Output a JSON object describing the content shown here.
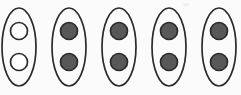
{
  "figure": {
    "background_color": "#fbfbfb",
    "outline_color": "#2b2b2b",
    "filled_circle_color": "#585858",
    "open_circle_color": "#ffffff",
    "canvas": {
      "width": 241,
      "height": 95
    },
    "ellipse_count": 5,
    "circles_per_ellipse": 2,
    "clipped_right_edge": true,
    "items": [
      {
        "index": 1,
        "label": "ellipse-1",
        "center_x": 19,
        "center_y": 47,
        "radius_x": 17,
        "radius_y": 39,
        "stroke_width": 1.7,
        "fill_state": "open",
        "circles": [
          {
            "label": "circle-1-top",
            "cx": 19,
            "cy": 31,
            "r": 8.5,
            "fill": "#ffffff",
            "stroke": "#2b2b2b",
            "stroke_width": 1.7
          },
          {
            "label": "circle-1-bottom",
            "cx": 19,
            "cy": 62,
            "r": 8.5,
            "fill": "#ffffff",
            "stroke": "#2b2b2b",
            "stroke_width": 1.7
          }
        ]
      },
      {
        "index": 2,
        "label": "ellipse-2",
        "center_x": 69,
        "center_y": 47,
        "radius_x": 17,
        "radius_y": 39,
        "stroke_width": 1.7,
        "fill_state": "filled",
        "circles": [
          {
            "label": "circle-2-top",
            "cx": 69,
            "cy": 31,
            "r": 8.5,
            "fill": "#585858",
            "stroke": "#2b2b2b",
            "stroke_width": 1.7
          },
          {
            "label": "circle-2-bottom",
            "cx": 69,
            "cy": 62,
            "r": 8.5,
            "fill": "#585858",
            "stroke": "#2b2b2b",
            "stroke_width": 1.7
          }
        ]
      },
      {
        "index": 3,
        "label": "ellipse-3",
        "center_x": 119,
        "center_y": 47,
        "radius_x": 17,
        "radius_y": 39,
        "stroke_width": 1.7,
        "fill_state": "filled",
        "circles": [
          {
            "label": "circle-3-top",
            "cx": 119,
            "cy": 31,
            "r": 8.5,
            "fill": "#585858",
            "stroke": "#2b2b2b",
            "stroke_width": 1.7
          },
          {
            "label": "circle-3-bottom",
            "cx": 119,
            "cy": 62,
            "r": 8.5,
            "fill": "#585858",
            "stroke": "#2b2b2b",
            "stroke_width": 1.7
          }
        ]
      },
      {
        "index": 4,
        "label": "ellipse-4",
        "center_x": 169,
        "center_y": 47,
        "radius_x": 17,
        "radius_y": 39,
        "stroke_width": 1.7,
        "fill_state": "filled",
        "circles": [
          {
            "label": "circle-4-top",
            "cx": 169,
            "cy": 31,
            "r": 8.5,
            "fill": "#585858",
            "stroke": "#2b2b2b",
            "stroke_width": 1.7
          },
          {
            "label": "circle-4-bottom",
            "cx": 169,
            "cy": 62,
            "r": 8.5,
            "fill": "#585858",
            "stroke": "#2b2b2b",
            "stroke_width": 1.7
          }
        ]
      },
      {
        "index": 5,
        "label": "ellipse-5",
        "center_x": 219,
        "center_y": 47,
        "radius_x": 17,
        "radius_y": 39,
        "stroke_width": 1.7,
        "fill_state": "filled",
        "circles": [
          {
            "label": "circle-5-top",
            "cx": 219,
            "cy": 31,
            "r": 8.5,
            "fill": "#585858",
            "stroke": "#2b2b2b",
            "stroke_width": 1.7
          },
          {
            "label": "circle-5-bottom",
            "cx": 219,
            "cy": 62,
            "r": 8.5,
            "fill": "#585858",
            "stroke": "#2b2b2b",
            "stroke_width": 1.7
          }
        ]
      }
    ],
    "artifacts": [
      {
        "label": "scan-speck-top",
        "x": 183,
        "y": 3
      }
    ]
  }
}
